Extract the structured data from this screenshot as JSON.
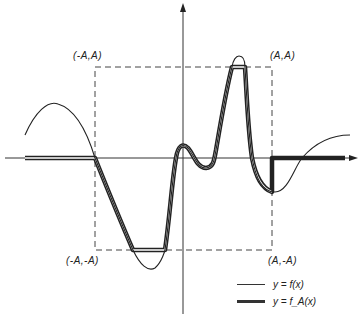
{
  "figure": {
    "corner_labels": {
      "top_left": "(-A,A)",
      "top_right": "(A,A)",
      "bottom_left": "(-A,-A)",
      "bottom_right": "(A,-A)"
    },
    "legend": [
      {
        "label": "y = f(x)",
        "style": "thin"
      },
      {
        "label": "y = f_A(x)",
        "style": "thick"
      }
    ],
    "colors": {
      "ink": "#222222",
      "background": "#ffffff"
    }
  }
}
